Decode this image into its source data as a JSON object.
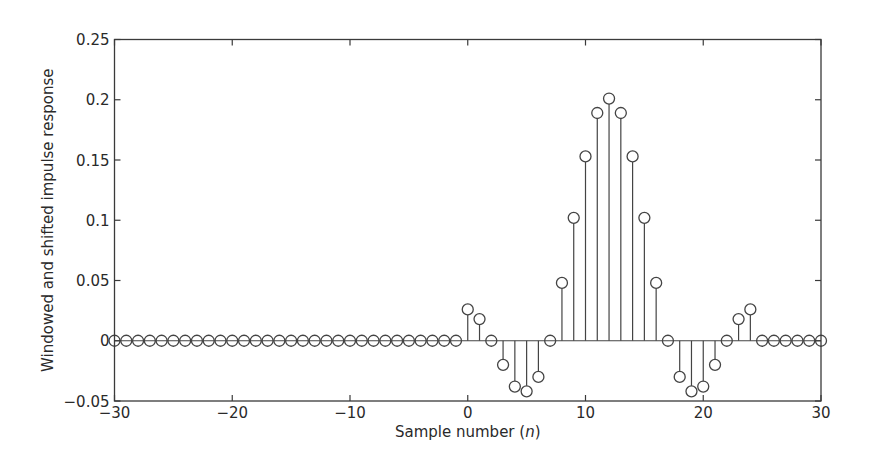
{
  "chart_data": {
    "type": "stem",
    "title": "",
    "xlabel": "Sample number (n)",
    "xlabel_parts": {
      "prefix": "Sample number (",
      "var": "n",
      "suffix": ")"
    },
    "ylabel": "Windowed and shifted impulse response",
    "xlim": [
      -30,
      30
    ],
    "ylim": [
      -0.05,
      0.25
    ],
    "xticks": [
      -30,
      -20,
      -10,
      0,
      10,
      20,
      30
    ],
    "xtick_labels": [
      "−30",
      "−20",
      "−10",
      "0",
      "10",
      "20",
      "30"
    ],
    "yticks": [
      -0.05,
      0,
      0.05,
      0.1,
      0.15,
      0.2,
      0.25
    ],
    "ytick_labels": [
      "−0.05",
      "0",
      "0.05",
      "0.1",
      "0.15",
      "0.2",
      "0.25"
    ],
    "grid": false,
    "legend": null,
    "marker": "open-circle",
    "x": [
      -30,
      -29,
      -28,
      -27,
      -26,
      -25,
      -24,
      -23,
      -22,
      -21,
      -20,
      -19,
      -18,
      -17,
      -16,
      -15,
      -14,
      -13,
      -12,
      -11,
      -10,
      -9,
      -8,
      -7,
      -6,
      -5,
      -4,
      -3,
      -2,
      -1,
      0,
      1,
      2,
      3,
      4,
      5,
      6,
      7,
      8,
      9,
      10,
      11,
      12,
      13,
      14,
      15,
      16,
      17,
      18,
      19,
      20,
      21,
      22,
      23,
      24,
      25,
      26,
      27,
      28,
      29,
      30
    ],
    "values": [
      0,
      0,
      0,
      0,
      0,
      0,
      0,
      0,
      0,
      0,
      0,
      0,
      0,
      0,
      0,
      0,
      0,
      0,
      0,
      0,
      0,
      0,
      0,
      0,
      0,
      0,
      0,
      0,
      0,
      0,
      0.026,
      0.018,
      0,
      -0.02,
      -0.038,
      -0.042,
      -0.03,
      0,
      0.048,
      0.102,
      0.153,
      0.189,
      0.201,
      0.189,
      0.153,
      0.102,
      0.048,
      0,
      -0.03,
      -0.042,
      -0.038,
      -0.02,
      0,
      0.018,
      0.026,
      0,
      0,
      0,
      0,
      0,
      0
    ]
  },
  "colors": {
    "line": "#444444",
    "frame": "#3a3a3a",
    "text": "#2a2a2a",
    "background": "#ffffff"
  }
}
